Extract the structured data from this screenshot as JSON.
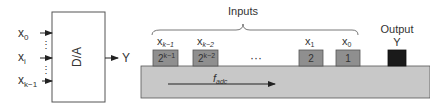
{
  "left_diagram": {
    "block_label": "D/A",
    "inputs": [
      {
        "name": "x",
        "sub": "0"
      },
      {
        "name": "x",
        "sub": "i"
      },
      {
        "name": "x",
        "sub": "k−1"
      }
    ],
    "ellipsis": "⋮",
    "output": "Y"
  },
  "right_diagram": {
    "inputs_label": "Inputs",
    "output_label": "Output",
    "output_symbol": "Y",
    "blocks": [
      {
        "var": "x",
        "sub": "k−1",
        "weight_base": "2",
        "weight_exp": "k−1"
      },
      {
        "var": "x",
        "sub": "k−2",
        "weight_base": "2",
        "weight_exp": "k−2"
      },
      {
        "var": "x",
        "sub": "1",
        "weight": "2"
      },
      {
        "var": "x",
        "sub": "0",
        "weight": "1"
      }
    ],
    "ellipsis": "···",
    "flow_label": "f",
    "flow_sub": "adc"
  },
  "colors": {
    "block_fill": "#8f8f8f",
    "belt_fill": "#c8c8c8",
    "output_fill": "#1a1a1a",
    "stroke": "#333333"
  }
}
